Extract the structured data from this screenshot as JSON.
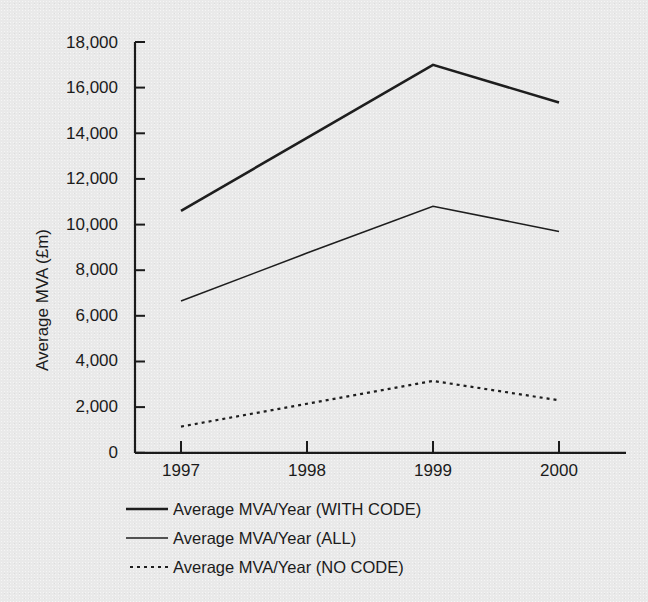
{
  "chart_data": {
    "type": "line",
    "title": "",
    "subtitle": "",
    "xlabel": "",
    "ylabel": "Average MVA (£m)",
    "categories": [
      "1997",
      "1998",
      "1999",
      "2000"
    ],
    "x": [
      1997,
      1998,
      1999,
      2000
    ],
    "xlim": [
      1996.6,
      2000.55
    ],
    "ylim": [
      0,
      18000
    ],
    "ytick_labels": [
      "0",
      "2,000",
      "4,000",
      "6,000",
      "8,000",
      "10,000",
      "12,000",
      "14,000",
      "16,000",
      "18,000"
    ],
    "ytick_values": [
      0,
      2000,
      4000,
      6000,
      8000,
      10000,
      12000,
      14000,
      16000,
      18000
    ],
    "xtick_labels": [
      "1997",
      "1998",
      "1999",
      "2000"
    ],
    "grid": false,
    "legend_position": "below-left",
    "series": [
      {
        "name": "Average MVA/Year (WITH CODE)",
        "style": "solid-thick",
        "values": [
          10600,
          13800,
          17000,
          15350
        ]
      },
      {
        "name": "Average MVA/Year (ALL)",
        "style": "solid-thin",
        "values": [
          6650,
          8750,
          10800,
          9700
        ]
      },
      {
        "name": "Average MVA/Year (NO CODE)",
        "style": "dotted",
        "values": [
          1150,
          2150,
          3150,
          2300
        ]
      }
    ],
    "colors": {
      "line": "#1e1e1e",
      "axis": "#1b1b1b",
      "text": "#1b1b1b",
      "background": "#e9e9e9"
    }
  },
  "axes": {
    "y_title": "Average MVA (£m)",
    "y_ticks": [
      {
        "label": "18,000"
      },
      {
        "label": "16,000"
      },
      {
        "label": "14,000"
      },
      {
        "label": "12,000"
      },
      {
        "label": "10,000"
      },
      {
        "label": "8,000"
      },
      {
        "label": "6,000"
      },
      {
        "label": "4,000"
      },
      {
        "label": "2,000"
      },
      {
        "label": "0"
      }
    ],
    "x_ticks": [
      {
        "label": "1997"
      },
      {
        "label": "1998"
      },
      {
        "label": "1999"
      },
      {
        "label": "2000"
      }
    ]
  },
  "legend": {
    "entries": [
      {
        "label": "Average MVA/Year (WITH CODE)",
        "style": "solid-thick"
      },
      {
        "label": "Average MVA/Year (ALL)",
        "style": "solid-thin"
      },
      {
        "label": "Average MVA/Year (NO CODE)",
        "style": "dotted"
      }
    ]
  }
}
